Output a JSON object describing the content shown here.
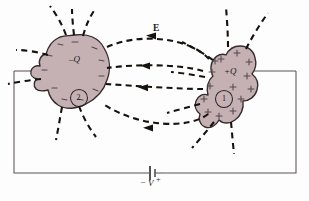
{
  "figure": {
    "background_color": "#fdfdfd",
    "conductor_fill": "#c5b0b3",
    "conductor_stroke": "#332b2c",
    "wire_color": "#55504f",
    "field_line_color": "#16130f",
    "label_color": "#1a1a1a"
  },
  "conductors": {
    "left": {
      "charge_label": "–Q",
      "index_label": "2",
      "surface_sign": "–",
      "polarity": "negative"
    },
    "right": {
      "charge_label": "+Q",
      "index_label": "1",
      "surface_sign": "+",
      "polarity": "positive"
    }
  },
  "field": {
    "label": "E",
    "line_style": "dashed",
    "arrow_direction": "right-to-left"
  },
  "circuit": {
    "battery_label": "V",
    "negative_terminal": "–",
    "positive_terminal": "+"
  },
  "surface_charges": {
    "left_signs": [
      "–",
      "–",
      "–",
      "–",
      "–",
      "–",
      "–",
      "–",
      "–",
      "–",
      "–"
    ],
    "right_signs": [
      "+",
      "+",
      "+",
      "+",
      "+",
      "+",
      "+",
      "+",
      "+",
      "+",
      "+",
      "+",
      "+",
      "+"
    ]
  }
}
